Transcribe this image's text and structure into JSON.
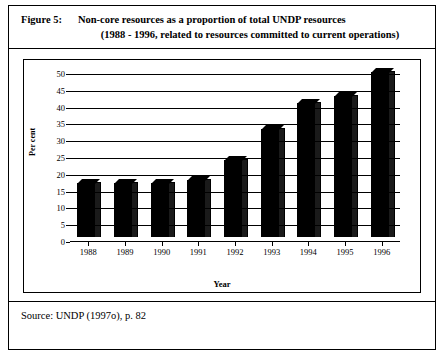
{
  "figure": {
    "label": "Figure 5:",
    "title_line1": "Non-core resources as a proportion of total UNDP resources",
    "title_line2": "(1988 - 1996, related to resources committed to current operations)",
    "source": "Source:   UNDP (1997o), p. 82"
  },
  "chart_data": {
    "type": "bar",
    "title": "Non-core resources as a proportion of total UNDP resources",
    "xlabel": "Year",
    "ylabel": "Per cent",
    "categories": [
      "1988",
      "1989",
      "1990",
      "1991",
      "1992",
      "1993",
      "1994",
      "1995",
      "1996"
    ],
    "values": [
      16,
      16,
      16,
      17,
      23,
      32,
      40,
      42,
      49
    ],
    "ylim": [
      0,
      50
    ],
    "yticks": [
      0,
      5,
      10,
      15,
      20,
      25,
      30,
      35,
      40,
      45,
      50
    ],
    "ytick_labels": [
      "0",
      "5",
      "10",
      "15",
      "20",
      "25",
      "30",
      "35",
      "40",
      "45",
      "50"
    ],
    "grid": true,
    "legend": null,
    "bar_color": "#000000"
  }
}
